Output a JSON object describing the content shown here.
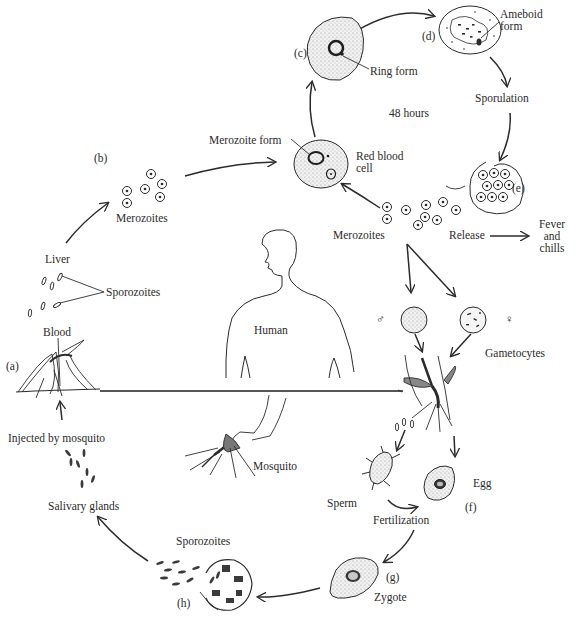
{
  "diagram": {
    "stages": [
      {
        "id": "a",
        "label": "(a)",
        "name": "Mosquito bite"
      },
      {
        "id": "b",
        "label": "(b)",
        "name": "Liver merozoites"
      },
      {
        "id": "c",
        "label": "(c)",
        "name": "Ring form"
      },
      {
        "id": "d",
        "label": "(d)",
        "name": "Ameboid form"
      },
      {
        "id": "e",
        "label": "(e)",
        "name": "Sporulation"
      },
      {
        "id": "f",
        "label": "(f)",
        "name": "Egg"
      },
      {
        "id": "g",
        "label": "(g)",
        "name": "Zygote"
      },
      {
        "id": "h",
        "label": "(h)",
        "name": "Sporozoites in oocyst"
      }
    ],
    "labels": {
      "merozoite_form": "Merozoite form",
      "merozoites_b": "Merozoites",
      "ring_form": "Ring form",
      "ameboid_form_1": "Ameboid",
      "ameboid_form_2": "form",
      "sporulation": "Sporulation",
      "hours": "48 hours",
      "red_blood_cell_1": "Red blood",
      "red_blood_cell_2": "cell",
      "merozoites_e": "Merozoites",
      "release": "Release",
      "fever_1": "Fever",
      "fever_2": "and",
      "fever_3": "chills",
      "liver": "Liver",
      "sporozoites_blood": "Sporozoites",
      "blood": "Blood",
      "human": "Human",
      "male_symbol": "♂",
      "female_symbol": "♀",
      "gametocytes": "Gametocytes",
      "injected": "Injected by mosquito",
      "mosquito": "Mosquito",
      "salivary": "Salivary glands",
      "sporozoites_h": "Sporozoites",
      "sperm": "Sperm",
      "fertilization": "Fertilization",
      "egg": "Egg",
      "zygote": "Zygote"
    },
    "colors": {
      "ink": "#2b2b2b",
      "stipple": "#e4e4e4",
      "background": "#ffffff"
    }
  }
}
